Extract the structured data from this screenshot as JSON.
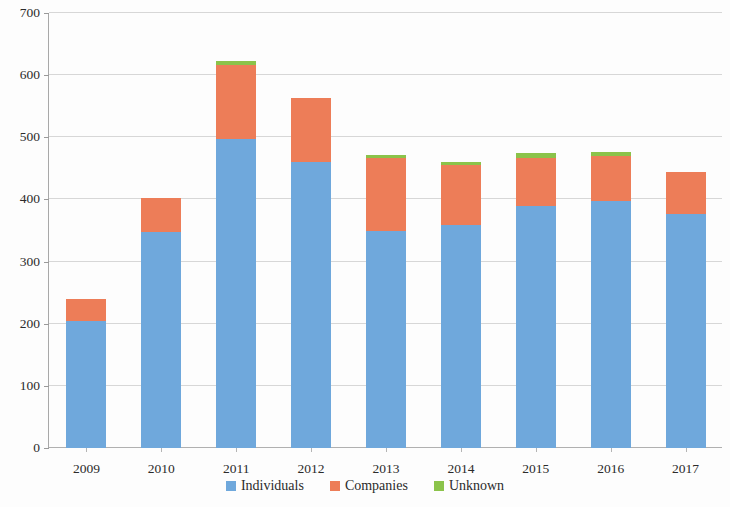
{
  "chart_data": {
    "type": "bar",
    "stacked": true,
    "title": "",
    "subtitle": "",
    "xlabel": "",
    "ylabel": "",
    "categories": [
      "2009",
      "2010",
      "2011",
      "2012",
      "2013",
      "2014",
      "2015",
      "2016",
      "2017"
    ],
    "series": [
      {
        "name": "Individuals",
        "color": "#6fa8dc",
        "values": [
          205,
          348,
          498,
          461,
          350,
          359,
          390,
          398,
          377
        ]
      },
      {
        "name": "Companies",
        "color": "#ed7d58",
        "values": [
          35,
          55,
          118,
          103,
          117,
          97,
          77,
          72,
          67
        ]
      },
      {
        "name": "Unknown",
        "color": "#8bc34a",
        "values": [
          0,
          0,
          6,
          0,
          5,
          5,
          8,
          7,
          0
        ]
      }
    ],
    "totals": [
      240,
      403,
      622,
      564,
      467,
      461,
      475,
      477,
      444
    ],
    "ylim": [
      0,
      700
    ],
    "ytick_values": [
      0,
      100,
      200,
      300,
      400,
      500,
      600,
      700
    ],
    "ytick_labels": [
      "0",
      "100",
      "200",
      "300",
      "400",
      "500",
      "600",
      "700"
    ],
    "grid": true,
    "grid_axis": "y",
    "legend_position": "bottom",
    "legend_entries": [
      "Individuals",
      "Companies",
      "Unknown"
    ]
  }
}
